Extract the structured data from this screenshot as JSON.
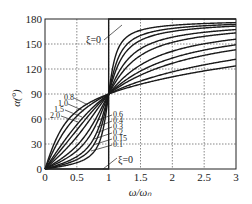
{
  "chart_data": {
    "type": "line",
    "title": "",
    "xlabel": "ω/ω_n",
    "ylabel": "α(°)",
    "xlim": [
      0,
      3
    ],
    "ylim": [
      0,
      180
    ],
    "xticks": [
      0,
      0.5,
      1,
      1.5,
      2,
      2.5,
      3
    ],
    "yticks": [
      0,
      30,
      60,
      90,
      120,
      150,
      180
    ],
    "xtick_labels": [
      "0",
      "0.5",
      "1",
      "1.5",
      "2",
      "2.5",
      "3"
    ],
    "ytick_labels": [
      "0",
      "30",
      "60",
      "90",
      "120",
      "150",
      "180"
    ],
    "grid": true,
    "legend": "inline curve labels",
    "formula": "α = atan2(2ξ(ω/ω_n), 1 − (ω/ω_n)²)",
    "series": [
      {
        "name": "ξ=0",
        "xi": 0
      },
      {
        "name": "0.1",
        "xi": 0.1
      },
      {
        "name": "0.15",
        "xi": 0.15
      },
      {
        "name": "0.2",
        "xi": 0.2
      },
      {
        "name": "0.3",
        "xi": 0.3
      },
      {
        "name": "0.4",
        "xi": 0.4
      },
      {
        "name": "0.6",
        "xi": 0.6
      },
      {
        "name": "0.8",
        "xi": 0.8
      },
      {
        "name": "1.0",
        "xi": 1.0
      },
      {
        "name": "1.5",
        "xi": 1.5
      },
      {
        "name": "2.0",
        "xi": 2.0
      }
    ],
    "annotations": [
      {
        "text": "ξ=0",
        "position": "upper, near x≈0.7, y≈150"
      },
      {
        "text": "ξ=0",
        "position": "lower, near x≈1.2, y≈15"
      },
      {
        "text": "0.8",
        "position": "left of ω/ωn=1, above curves"
      },
      {
        "text": "1.0",
        "position": "left"
      },
      {
        "text": "1.5",
        "position": "left"
      },
      {
        "text": "2.0",
        "position": "left"
      },
      {
        "text": "0.6",
        "position": "right of x=1"
      },
      {
        "text": "0.4",
        "position": "right of x=1"
      },
      {
        "text": "0.3",
        "position": "right of x=1"
      },
      {
        "text": "0.2",
        "position": "right of x=1"
      },
      {
        "text": "0.15",
        "position": "right of x=1"
      },
      {
        "text": "0.1",
        "position": "right of x=1"
      }
    ]
  },
  "axes": {
    "ylabel": "α(°)",
    "xlabel": "ω/ωₙ"
  },
  "labels": {
    "xi0_top": "ξ=0",
    "xi0_bottom": "ξ=0",
    "left": [
      "0.8",
      "1.0",
      "1.5",
      "2.0"
    ],
    "right": [
      "0.6",
      "0.4",
      "0.3",
      "0.2",
      "0.15",
      "0.1"
    ]
  }
}
